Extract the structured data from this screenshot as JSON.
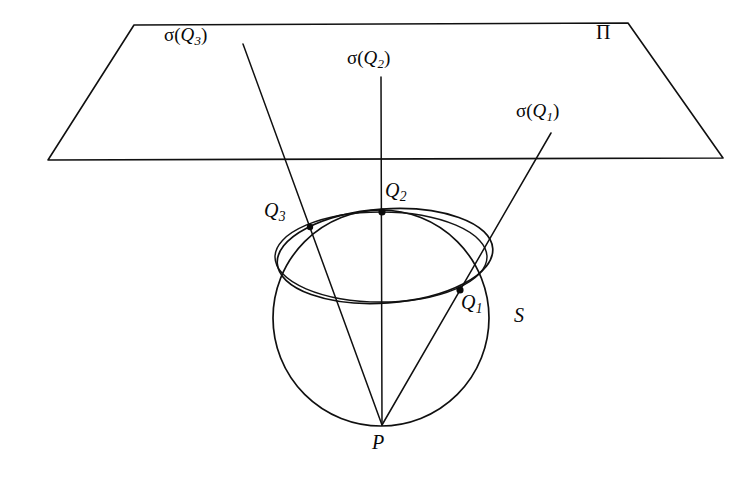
{
  "figure": {
    "background_color": "#ffffff",
    "ink_color": "#101010",
    "width": 750,
    "height": 479
  },
  "labels": {
    "plane": {
      "text": "Π",
      "name": "plane-pi-label",
      "x": 596,
      "y": 22
    },
    "sphere": {
      "text": "S",
      "name": "sphere-s-label",
      "x": 514,
      "y": 305
    },
    "apex": {
      "text": "P",
      "name": "point-p-label",
      "x": 372,
      "y": 432
    },
    "points": [
      {
        "name": "point-q1-label",
        "base": "Q",
        "sub": "1",
        "x": 461,
        "y": 292
      },
      {
        "name": "point-q2-label",
        "base": "Q",
        "sub": "2",
        "x": 385,
        "y": 180
      },
      {
        "name": "point-q3-label",
        "base": "Q",
        "sub": "3",
        "x": 264,
        "y": 200
      }
    ],
    "images": [
      {
        "name": "sigma-q1-label",
        "prefix": "σ(",
        "base": "Q",
        "sub": "1",
        "suffix": ")",
        "x": 516,
        "y": 101
      },
      {
        "name": "sigma-q2-label",
        "prefix": "σ(",
        "base": "Q",
        "sub": "2",
        "suffix": ")",
        "x": 347,
        "y": 48
      },
      {
        "name": "sigma-q3-label",
        "prefix": "σ(",
        "base": "Q",
        "sub": "3",
        "suffix": ")",
        "x": 164,
        "y": 25
      }
    ]
  },
  "geometry": {
    "plane_trapezoid": {
      "name": "projection-plane-pi",
      "points": "134,25 628,23 723,158 48,160"
    },
    "sphere_circle": {
      "name": "sphere-s-outline",
      "cx": 381,
      "cy": 318,
      "r": 108
    },
    "tangency_ellipse": {
      "name": "horizontal-circle-ellipse",
      "cx": 381,
      "cy": 257,
      "rx": 106,
      "ry": 45,
      "rotation": 0
    },
    "conic_ellipse": {
      "name": "conic-section-ellipse",
      "cx": 385,
      "cy": 256,
      "rx": 108,
      "ry": 47,
      "rotation": -4
    },
    "apex_point": {
      "name": "point-p",
      "x": 382,
      "y": 425
    },
    "rays": [
      {
        "name": "ray-p-q1-sigma-q1",
        "from": "382,425",
        "to": "551,133",
        "through_point": {
          "x": 460,
          "y": 290
        }
      },
      {
        "name": "ray-p-q2-sigma-q2",
        "from": "382,425",
        "to": "381,77",
        "through_point": {
          "x": 382,
          "y": 212
        }
      },
      {
        "name": "ray-p-q3-sigma-q3",
        "from": "382,425",
        "to": "243,44",
        "through_point": {
          "x": 310,
          "y": 227
        }
      }
    ],
    "marked_points": [
      {
        "name": "point-q1",
        "x": 460,
        "y": 290
      },
      {
        "name": "point-q2",
        "x": 382,
        "y": 212
      },
      {
        "name": "point-q3",
        "x": 310,
        "y": 227
      }
    ]
  }
}
